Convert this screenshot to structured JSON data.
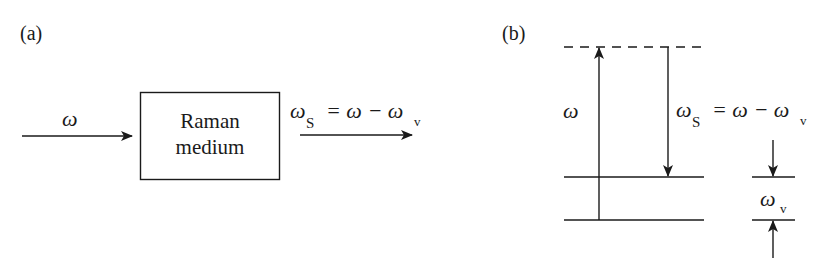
{
  "panel_a": {
    "label": "(a)",
    "input_label": "ω",
    "box_line1": "Raman",
    "box_line2": "medium",
    "output_omega": "ω",
    "output_sub": "S",
    "output_eq": "= ω − ω",
    "output_eq_sub": "v"
  },
  "panel_b": {
    "label": "(b)",
    "pump_label": "ω",
    "stokes_omega": "ω",
    "stokes_sub": "S",
    "stokes_eq": "= ω − ω",
    "stokes_eq_sub": "v",
    "vib_omega": "ω",
    "vib_sub": "v"
  },
  "colors": {
    "ink": "#1a1a1a",
    "background": "#ffffff"
  }
}
